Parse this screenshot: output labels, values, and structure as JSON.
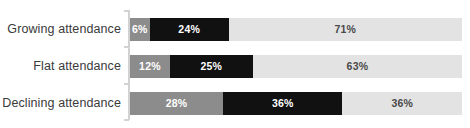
{
  "chart_data": {
    "type": "bar",
    "orientation": "horizontal",
    "stacked": true,
    "normalized_percent": true,
    "title": "",
    "subtitle": "",
    "xlabel": "",
    "ylabel": "",
    "xlim": [
      0,
      100
    ],
    "grid": false,
    "legend": "none",
    "categories": [
      "Growing attendance",
      "Flat attendance",
      "Declining attendance"
    ],
    "series": [
      {
        "name": "segment-1",
        "color": "#8c8c8c",
        "label_color": "#ffffff",
        "values": [
          6,
          12,
          28
        ],
        "labels": [
          "6%",
          "12%",
          "28%"
        ]
      },
      {
        "name": "segment-2",
        "color": "#111111",
        "label_color": "#ffffff",
        "values": [
          24,
          25,
          36
        ],
        "labels": [
          "24%",
          "25%",
          "36%"
        ]
      },
      {
        "name": "segment-3",
        "color": "#e3e3e3",
        "label_color": "#4a4a4a",
        "values": [
          71,
          63,
          36
        ],
        "labels": [
          "71%",
          "63%",
          "36%"
        ]
      }
    ]
  },
  "axis": {
    "line_color": "#d2d2d2",
    "tick_count": 4
  },
  "style": {
    "background": "#ffffff",
    "label_color": "#3a3a3a"
  }
}
